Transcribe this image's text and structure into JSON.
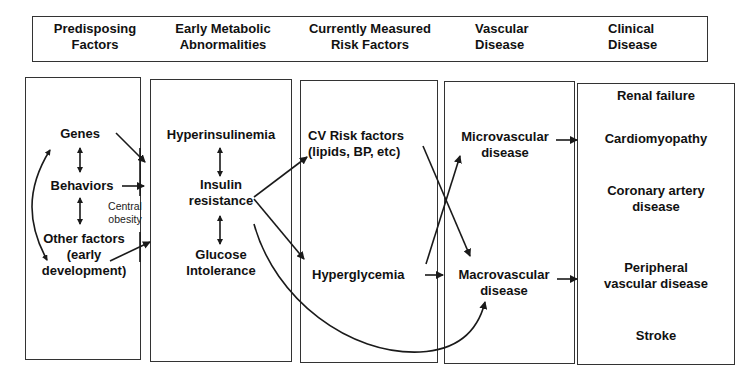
{
  "header": {
    "columns": [
      {
        "line1": "Predisposing",
        "line2": "Factors"
      },
      {
        "line1": "Early Metabolic",
        "line2": "Abnormalities"
      },
      {
        "line1": "Currently Measured",
        "line2": "Risk Factors"
      },
      {
        "line1": "Vascular",
        "line2": "Disease"
      },
      {
        "line1": "Clinical",
        "line2": "Disease"
      }
    ]
  },
  "predisposing": {
    "genes": "Genes",
    "behaviors": "Behaviors",
    "other_line1": "Other factors",
    "other_line2": "(early",
    "other_line3": "development)",
    "central_line1": "Central",
    "central_line2": "obesity"
  },
  "metabolic": {
    "hyperinsulinemia": "Hyperinsulinemia",
    "insulin_line1": "Insulin",
    "insulin_line2": "resistance",
    "glucose_line1": "Glucose",
    "glucose_line2": "Intolerance"
  },
  "risk_factors": {
    "cv_line1": "CV Risk factors",
    "cv_line2": "(lipids, BP, etc)",
    "hyperglycemia": "Hyperglycemia"
  },
  "vascular": {
    "micro_line1": "Microvascular",
    "micro_line2": "disease",
    "macro_line1": "Macrovascular",
    "macro_line2": "disease"
  },
  "clinical": {
    "items": [
      {
        "line1": "Renal failure",
        "line2": ""
      },
      {
        "line1": "Cardiomyopathy",
        "line2": ""
      },
      {
        "line1": "Coronary artery",
        "line2": "disease"
      },
      {
        "line1": "Peripheral",
        "line2": "vascular disease"
      },
      {
        "line1": "Stroke",
        "line2": ""
      }
    ]
  },
  "colors": {
    "line": "#1a1a1a",
    "border": "#333333",
    "background": "#ffffff"
  }
}
